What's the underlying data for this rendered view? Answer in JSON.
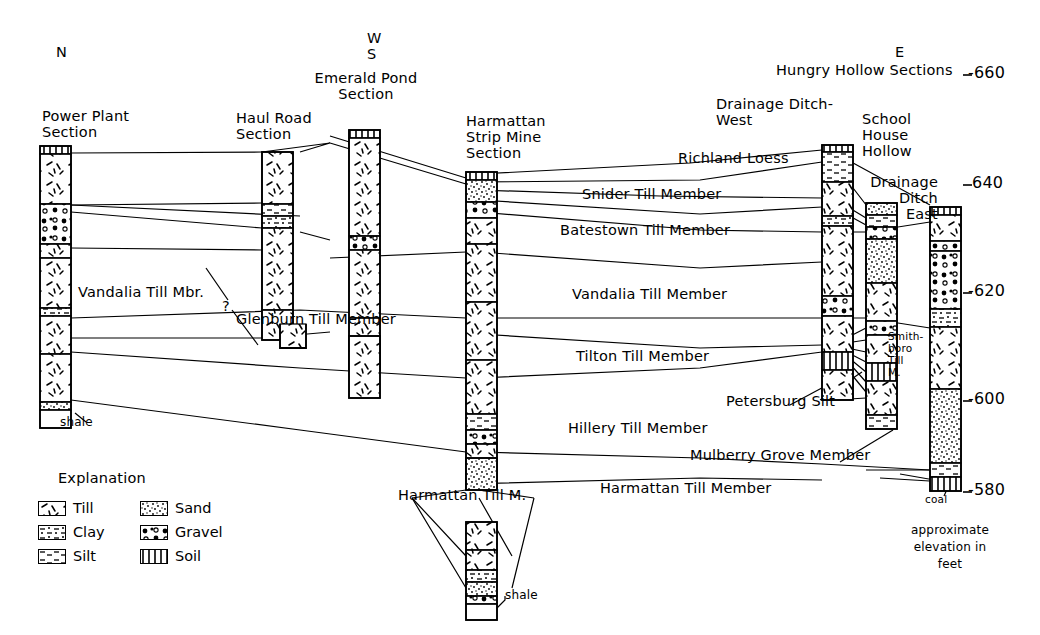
{
  "figure": {
    "type": "stratigraphic-cross-section",
    "compass": {
      "north": "N",
      "westsouth_top": "W",
      "westsouth_bottom": "S",
      "east": "E"
    },
    "group_label": "Hungry Hollow Sections",
    "elevation_caption": "approximate\nelevation in\nfeet",
    "elevation_axis": {
      "unit": "feet",
      "ticks": [
        "-660",
        "640",
        "-620",
        "-600",
        "-580"
      ],
      "values": [
        660,
        640,
        620,
        600,
        580
      ]
    }
  },
  "sections": [
    {
      "id": "power-plant",
      "title": "Power Plant\nSection"
    },
    {
      "id": "haul-road",
      "title": "Haul Road\nSection"
    },
    {
      "id": "emerald-pond",
      "title": "Emerald Pond\nSection"
    },
    {
      "id": "harmattan",
      "title": "Harmattan\nStrip Mine\nSection"
    },
    {
      "id": "drainage-ditch-west",
      "title": "Drainage Ditch-\nWest"
    },
    {
      "id": "school-house-hollow",
      "title": "School\nHouse\nHollow"
    },
    {
      "id": "drainage-ditch-east",
      "title": "Drainage\nDitch\nEast"
    }
  ],
  "units": [
    {
      "id": "richland-loess",
      "label": "Richland Loess"
    },
    {
      "id": "snider",
      "label": "Snider Till Member"
    },
    {
      "id": "batestown",
      "label": "Batestown Till Member"
    },
    {
      "id": "vandalia",
      "label": "Vandalia Till Member"
    },
    {
      "id": "vandalia-mbr",
      "label": "Vandalia Till Mbr."
    },
    {
      "id": "query",
      "label": "?"
    },
    {
      "id": "glenburn",
      "label": "Glenburn Till Member"
    },
    {
      "id": "tilton",
      "label": "Tilton Till Member"
    },
    {
      "id": "hillery",
      "label": "Hillery Till Member"
    },
    {
      "id": "petersburg",
      "label": "Petersburg Silt"
    },
    {
      "id": "mulberry-grove",
      "label": "Mulberry Grove Member"
    },
    {
      "id": "harmattan-member",
      "label": "Harmattan Till Member"
    },
    {
      "id": "harmattan-m",
      "label": "Harmattan Till M."
    },
    {
      "id": "smithboro",
      "label": "Smith-\nboro\nTill\nM."
    }
  ],
  "bedrock": [
    {
      "id": "shale-left",
      "label": "shale"
    },
    {
      "id": "shale-bottom",
      "label": "shale"
    },
    {
      "id": "coal",
      "label": "coal"
    }
  ],
  "legend": {
    "title": "Explanation",
    "items": [
      {
        "key": "till",
        "label": "Till",
        "pattern": "till"
      },
      {
        "key": "clay",
        "label": "Clay",
        "pattern": "clay"
      },
      {
        "key": "silt",
        "label": "Silt",
        "pattern": "silt"
      },
      {
        "key": "sand",
        "label": "Sand",
        "pattern": "sand"
      },
      {
        "key": "gravel",
        "label": "Gravel",
        "pattern": "gravel"
      },
      {
        "key": "soil",
        "label": "Soil",
        "pattern": "soil"
      }
    ]
  },
  "colors": {
    "ink": "#000000",
    "paper": "#ffffff"
  }
}
